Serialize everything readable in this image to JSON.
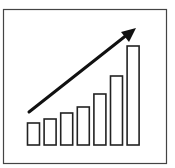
{
  "icon": {
    "name": "growth-bar-chart-icon",
    "stroke_color": "#222222",
    "background": "#ffffff"
  },
  "chart_data": {
    "type": "bar",
    "title": "",
    "xlabel": "",
    "ylabel": "",
    "categories": [
      "1",
      "2",
      "3",
      "4",
      "5",
      "6",
      "7"
    ],
    "values": [
      22,
      26,
      32,
      38,
      51,
      69,
      99
    ],
    "trend": "upward-arrow",
    "grid": false,
    "legend": "none"
  }
}
